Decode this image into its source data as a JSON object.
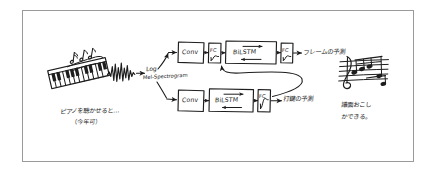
{
  "canvas": {
    "width": 437,
    "height": 175,
    "background": "#ffffff",
    "ink_color": "#1d1d1d",
    "border_color": "#9a9a9a",
    "medium": "hand-drawn sketch"
  },
  "scene": {
    "title": "Hand-drawn piano automatic music transcription pipeline sketch"
  },
  "input_stage": {
    "music_notes_icon": "eighth-notes",
    "piano_icon": "piano-keyboard",
    "caption_line1": "ピアノを聴かせると…",
    "caption_line2": "（今年可）",
    "waveform_icon": "audio-waveform"
  },
  "feature_stage": {
    "label_line1": "Log",
    "label_line2": "Mel-Spectrogram"
  },
  "network": {
    "top_branch": {
      "name": "frame-branch",
      "blocks": [
        {
          "label": "Conv",
          "kind": "conv-block"
        },
        {
          "label": "FC",
          "kind": "fc-block-sigmoid"
        },
        {
          "label": "BiLSTM",
          "kind": "bilstm-block"
        },
        {
          "label": "FC",
          "kind": "fc-block-sigmoid"
        }
      ],
      "output_label": "フレームの予測"
    },
    "bottom_branch": {
      "name": "onset-branch",
      "blocks": [
        {
          "label": "Conv",
          "kind": "conv-block"
        },
        {
          "label": "BiLSTM",
          "kind": "bilstm-block"
        },
        {
          "label": "FC",
          "kind": "fc-block-sigmoid"
        }
      ],
      "output_label": "打鍵の予測"
    },
    "feedback_connection": "onset-output-into-frame-bilstm"
  },
  "output_stage": {
    "score_icon": "music-staff-treble-clef",
    "caption_line1": "譜面おこし",
    "caption_line2": "かできる。"
  }
}
